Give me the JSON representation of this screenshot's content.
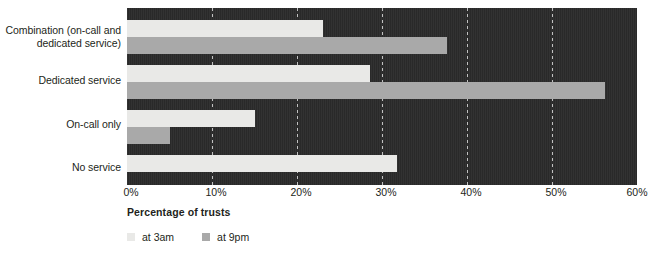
{
  "chart_data": {
    "type": "bar",
    "orientation": "horizontal",
    "title": "",
    "xlabel": "Percentage of trusts",
    "ylabel": "",
    "xlim": [
      0,
      60
    ],
    "xticks": [
      0,
      10,
      20,
      30,
      40,
      50,
      60
    ],
    "xtick_labels": [
      "0%",
      "10%",
      "20%",
      "30%",
      "40%",
      "50%",
      "60%"
    ],
    "grid": "vertical-dashed",
    "legend_position": "bottom-left",
    "categories": [
      "Combination (on-call and dedicated service)",
      "Dedicated service",
      "On-call only",
      "No service"
    ],
    "series": [
      {
        "name": "at 3am",
        "color": "#e9e9e7",
        "values": [
          23,
          28.6,
          15.1,
          31.8
        ]
      },
      {
        "name": "at 9pm",
        "color": "#a9a9a9",
        "values": [
          37.7,
          56.2,
          5.1,
          0
        ]
      }
    ],
    "plot_background": "#2b2b2b"
  },
  "axis": {
    "x_title": "Percentage of trusts"
  },
  "legend": {
    "items": [
      {
        "label": "at 3am",
        "color": "#e9e9e7"
      },
      {
        "label": "at 9pm",
        "color": "#a9a9a9"
      }
    ]
  }
}
